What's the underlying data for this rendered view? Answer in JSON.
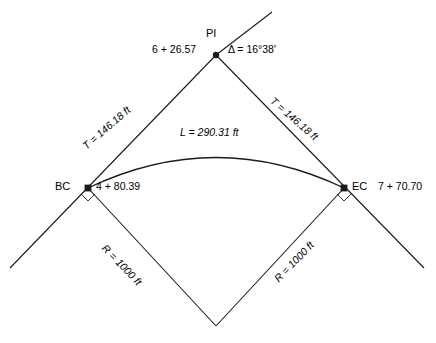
{
  "diagram": {
    "type": "horizontal-curve-survey",
    "nodes": {
      "pi": {
        "label": "PI",
        "station": "6 + 26.57",
        "delta": "Δ = 16°38′"
      },
      "bc": {
        "label": "BC",
        "station": "4 + 80.39"
      },
      "ec": {
        "label": "EC",
        "station": "7 + 70.70"
      }
    },
    "measurements": {
      "tangent_left": "T = 146.18 ft",
      "tangent_right": "T = 146.18 ft",
      "arc_length": "L = 290.31 ft",
      "radius_left": "R = 1000 ft",
      "radius_right": "R = 1000 ft"
    },
    "colors": {
      "line": "#1a1a1a",
      "text": "#000000",
      "background": "#ffffff"
    }
  }
}
